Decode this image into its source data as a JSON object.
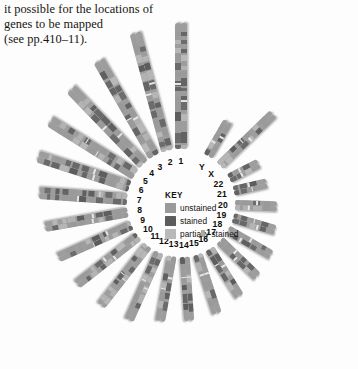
{
  "page": {
    "background_color": "#fdfdfd",
    "width": 358,
    "height": 369
  },
  "body_text": {
    "line1": "it possible for the locations of",
    "line2": "genes to be mapped",
    "line3": "(see pp.410–11)."
  },
  "key": {
    "title": "KEY",
    "items": [
      {
        "label": "unstained",
        "color": "#9a9a9a"
      },
      {
        "label": "stained",
        "color": "#5c5c5c"
      },
      {
        "label": "partially stained",
        "color": "#b9b9b9"
      }
    ]
  },
  "chart_data": {
    "type": "diagram",
    "legend_position": "center",
    "stain_colors": {
      "unstained": "#9a9a9a",
      "stained": "#5c5c5c",
      "partially_stained": "#b9b9b9",
      "backbone": "#9d9d9d"
    },
    "chromosomes": [
      {
        "label": "1",
        "angle": -90.0,
        "length": 126,
        "width": 5.6,
        "gap": 6.4,
        "radius": 54,
        "bands": [
          0.05,
          0.22,
          0.31,
          0.38,
          0.46,
          0.5,
          0.57,
          0.63,
          0.7,
          0.76,
          0.83,
          0.9,
          0.96
        ]
      },
      {
        "label": "2",
        "angle": -105.0,
        "length": 122,
        "width": 5.5,
        "gap": 6.2,
        "radius": 54,
        "bands": [
          0.04,
          0.12,
          0.2,
          0.29,
          0.36,
          0.44,
          0.52,
          0.6,
          0.68,
          0.75,
          0.84,
          0.92
        ]
      },
      {
        "label": "3",
        "angle": -120.0,
        "length": 110,
        "width": 5.5,
        "gap": 6.2,
        "radius": 54,
        "bands": [
          0.06,
          0.15,
          0.24,
          0.33,
          0.41,
          0.49,
          0.58,
          0.66,
          0.74,
          0.83,
          0.91
        ]
      },
      {
        "label": "4",
        "angle": -134.0,
        "length": 104,
        "width": 5.4,
        "gap": 6.0,
        "radius": 54,
        "bands": [
          0.05,
          0.14,
          0.23,
          0.32,
          0.42,
          0.51,
          0.6,
          0.7,
          0.79,
          0.88
        ]
      },
      {
        "label": "5",
        "angle": -148.0,
        "length": 100,
        "width": 5.4,
        "gap": 6.0,
        "radius": 54,
        "bands": [
          0.07,
          0.17,
          0.26,
          0.35,
          0.45,
          0.55,
          0.64,
          0.74,
          0.84,
          0.93
        ]
      },
      {
        "label": "6",
        "angle": -162.0,
        "length": 96,
        "width": 5.3,
        "gap": 5.8,
        "radius": 54,
        "bands": [
          0.06,
          0.16,
          0.26,
          0.36,
          0.46,
          0.56,
          0.66,
          0.76,
          0.86,
          0.94
        ]
      },
      {
        "label": "7",
        "angle": -176.0,
        "length": 88,
        "width": 5.3,
        "gap": 5.8,
        "radius": 54,
        "bands": [
          0.07,
          0.17,
          0.27,
          0.37,
          0.47,
          0.57,
          0.67,
          0.77,
          0.87,
          0.95
        ]
      },
      {
        "label": "8",
        "angle": 170.0,
        "length": 84,
        "width": 5.2,
        "gap": 5.7,
        "radius": 54,
        "bands": [
          0.08,
          0.19,
          0.3,
          0.41,
          0.52,
          0.63,
          0.74,
          0.85,
          0.94
        ]
      },
      {
        "label": "9",
        "angle": 156.0,
        "length": 80,
        "width": 5.2,
        "gap": 5.7,
        "radius": 54,
        "bands": [
          0.08,
          0.2,
          0.32,
          0.43,
          0.55,
          0.67,
          0.78,
          0.9
        ]
      },
      {
        "label": "10",
        "angle": 142.0,
        "length": 78,
        "width": 5.2,
        "gap": 5.6,
        "radius": 54,
        "bands": [
          0.09,
          0.21,
          0.33,
          0.45,
          0.57,
          0.69,
          0.81,
          0.92
        ]
      },
      {
        "label": "11",
        "angle": 128.0,
        "length": 76,
        "width": 5.1,
        "gap": 5.6,
        "radius": 54,
        "bands": [
          0.08,
          0.21,
          0.34,
          0.47,
          0.6,
          0.72,
          0.85,
          0.95
        ]
      },
      {
        "label": "12",
        "angle": 114.0,
        "length": 74,
        "width": 5.1,
        "gap": 5.5,
        "radius": 54,
        "bands": [
          0.09,
          0.22,
          0.35,
          0.48,
          0.61,
          0.74,
          0.87
        ]
      },
      {
        "label": "13",
        "angle": 100.0,
        "length": 66,
        "width": 4.9,
        "gap": 5.4,
        "radius": 54,
        "bands": [
          0.12,
          0.27,
          0.41,
          0.56,
          0.7,
          0.85
        ]
      },
      {
        "label": "14",
        "angle": 86.0,
        "length": 64,
        "width": 4.9,
        "gap": 5.4,
        "radius": 54,
        "bands": [
          0.12,
          0.28,
          0.43,
          0.58,
          0.73,
          0.88
        ]
      },
      {
        "label": "15",
        "angle": 72.0,
        "length": 62,
        "width": 4.9,
        "gap": 5.3,
        "radius": 54,
        "bands": [
          0.13,
          0.29,
          0.45,
          0.61,
          0.77,
          0.9
        ]
      },
      {
        "label": "16",
        "angle": 58.0,
        "length": 56,
        "width": 4.8,
        "gap": 5.2,
        "radius": 54,
        "bands": [
          0.14,
          0.32,
          0.5,
          0.68,
          0.86
        ]
      },
      {
        "label": "17",
        "angle": 44.0,
        "length": 52,
        "width": 4.8,
        "gap": 5.2,
        "radius": 54,
        "bands": [
          0.15,
          0.34,
          0.53,
          0.72,
          0.9
        ]
      },
      {
        "label": "18",
        "angle": 30.0,
        "length": 50,
        "width": 4.7,
        "gap": 5.1,
        "radius": 54,
        "bands": [
          0.16,
          0.36,
          0.56,
          0.76,
          0.92
        ]
      },
      {
        "label": "19",
        "angle": 16.0,
        "length": 44,
        "width": 4.7,
        "gap": 5.1,
        "radius": 54,
        "bands": [
          0.18,
          0.42,
          0.65,
          0.88
        ]
      },
      {
        "label": "20",
        "angle": 2.0,
        "length": 42,
        "width": 4.7,
        "gap": 5.0,
        "radius": 54,
        "bands": [
          0.19,
          0.44,
          0.68,
          0.9
        ]
      },
      {
        "label": "21",
        "angle": -13.0,
        "length": 34,
        "width": 4.6,
        "gap": 5.0,
        "radius": 54,
        "bands": [
          0.22,
          0.5,
          0.78
        ]
      },
      {
        "label": "22",
        "angle": -27.0,
        "length": 33,
        "width": 4.6,
        "gap": 5.0,
        "radius": 54,
        "bands": [
          0.23,
          0.52,
          0.8
        ]
      },
      {
        "label": "X",
        "angle": -44.0,
        "length": 74,
        "width": 5.1,
        "gap": 5.5,
        "radius": 54,
        "bands": [
          0.1,
          0.24,
          0.38,
          0.52,
          0.66,
          0.8,
          0.93
        ]
      },
      {
        "label": "Y",
        "angle": -60.0,
        "length": 40,
        "width": 4.8,
        "gap": 5.2,
        "radius": 54,
        "bands": [
          0.2,
          0.46,
          0.72,
          0.93
        ]
      }
    ]
  }
}
